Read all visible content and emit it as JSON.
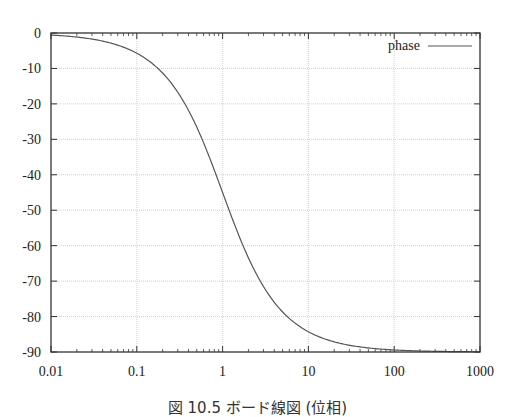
{
  "chart_data": {
    "type": "line",
    "title": "",
    "xlabel": "",
    "ylabel": "",
    "xscale": "log",
    "xlim": [
      0.01,
      1000
    ],
    "ylim": [
      -90,
      0
    ],
    "grid": true,
    "legend_position": "top-right",
    "x_ticks": [
      "0.01",
      "0.1",
      "1",
      "10",
      "100",
      "1000"
    ],
    "y_ticks": [
      "0",
      "-10",
      "-20",
      "-30",
      "-40",
      "-50",
      "-60",
      "-70",
      "-80",
      "-90"
    ],
    "series": [
      {
        "name": "phase",
        "color": "#555555",
        "x": [
          0.01,
          0.02,
          0.05,
          0.1,
          0.2,
          0.3,
          0.5,
          0.7,
          1,
          1.5,
          2,
          3,
          5,
          7,
          10,
          20,
          50,
          100,
          200,
          500,
          1000
        ],
        "y": [
          -0.57,
          -1.15,
          -2.86,
          -5.71,
          -11.31,
          -16.7,
          -26.57,
          -34.99,
          -45.0,
          -56.31,
          -63.43,
          -71.57,
          -78.69,
          -81.87,
          -84.29,
          -87.14,
          -88.85,
          -89.43,
          -89.71,
          -89.89,
          -89.94
        ]
      }
    ]
  },
  "legend": {
    "label": "phase"
  },
  "caption": "図 10.5 ボード線図 (位相)",
  "colors": {
    "curve": "#555555",
    "axis": "#333333",
    "grid": "#c8c8c8",
    "background": "#ffffff"
  }
}
